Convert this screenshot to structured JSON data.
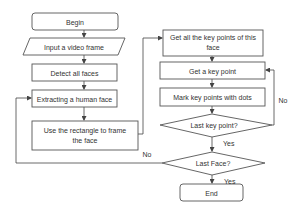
{
  "diagram": {
    "type": "flowchart",
    "nodes": {
      "begin": "Begin",
      "input_frame": "Input a video frame",
      "detect_faces": "Detect all faces",
      "extract_face": "Extracting a human face",
      "frame_face_line1": "Use the rectangle to frame",
      "frame_face_line2": "the face",
      "get_all_points_line1": "Get all the key points of this",
      "get_all_points_line2": "face",
      "get_point": "Get a key point",
      "mark_points": "Mark key points with dots",
      "last_key_point": "Last key point?",
      "last_face": "Last Face?",
      "end": "End"
    },
    "edge_labels": {
      "last_key_point_no": "No",
      "last_key_point_yes": "Yes",
      "last_face_no": "No",
      "last_face_yes": "Yes"
    },
    "colors": {
      "stroke": "#555555",
      "text": "#333333",
      "background": "#ffffff"
    }
  }
}
